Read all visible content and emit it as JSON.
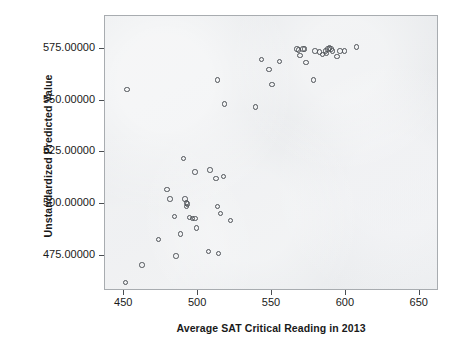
{
  "chart_data": {
    "type": "scatter",
    "title": "",
    "xlabel": "Average SAT Critical Reading in 2013",
    "ylabel": "Unstandardized Predicted Value",
    "xlim": [
      437,
      663
    ],
    "ylim": [
      458,
      591
    ],
    "xticks": [
      450,
      500,
      550,
      600,
      650
    ],
    "yticks": [
      475,
      500,
      525,
      550,
      575
    ],
    "xtick_labels": [
      "450",
      "500",
      "550",
      "600",
      "650"
    ],
    "ytick_labels": [
      "475.00000",
      "500.00000",
      "525.00000",
      "550.00000",
      "575.00000"
    ],
    "grid": false,
    "legend": null,
    "marker": "open-circle",
    "marker_color": "#4f5358",
    "plot_background": "#e8eaec",
    "points": [
      {
        "x": 451,
        "y": 462
      },
      {
        "x": 452,
        "y": 555.5
      },
      {
        "x": 462,
        "y": 470.5
      },
      {
        "x": 473,
        "y": 483
      },
      {
        "x": 479,
        "y": 507
      },
      {
        "x": 481,
        "y": 502.5
      },
      {
        "x": 484,
        "y": 494
      },
      {
        "x": 485,
        "y": 475
      },
      {
        "x": 488,
        "y": 485.5
      },
      {
        "x": 490,
        "y": 522
      },
      {
        "x": 491,
        "y": 502.5
      },
      {
        "x": 492,
        "y": 500.5
      },
      {
        "x": 492,
        "y": 499
      },
      {
        "x": 493,
        "y": 500
      },
      {
        "x": 494,
        "y": 493.5
      },
      {
        "x": 496,
        "y": 493
      },
      {
        "x": 498,
        "y": 493
      },
      {
        "x": 498,
        "y": 515.5
      },
      {
        "x": 499,
        "y": 488.5
      },
      {
        "x": 507,
        "y": 477
      },
      {
        "x": 508,
        "y": 516.5
      },
      {
        "x": 512,
        "y": 512.5
      },
      {
        "x": 513,
        "y": 560
      },
      {
        "x": 513,
        "y": 499
      },
      {
        "x": 514,
        "y": 476
      },
      {
        "x": 515,
        "y": 495.5
      },
      {
        "x": 517,
        "y": 513.5
      },
      {
        "x": 518,
        "y": 548.5
      },
      {
        "x": 522,
        "y": 492
      },
      {
        "x": 539,
        "y": 547
      },
      {
        "x": 543,
        "y": 570
      },
      {
        "x": 548,
        "y": 565
      },
      {
        "x": 550,
        "y": 558
      },
      {
        "x": 555,
        "y": 569
      },
      {
        "x": 567,
        "y": 575
      },
      {
        "x": 568,
        "y": 574.5
      },
      {
        "x": 569,
        "y": 572
      },
      {
        "x": 571,
        "y": 575
      },
      {
        "x": 572,
        "y": 575
      },
      {
        "x": 573,
        "y": 568.5
      },
      {
        "x": 578,
        "y": 560
      },
      {
        "x": 579,
        "y": 574
      },
      {
        "x": 582,
        "y": 573.5
      },
      {
        "x": 584,
        "y": 572.5
      },
      {
        "x": 586,
        "y": 574
      },
      {
        "x": 587,
        "y": 573
      },
      {
        "x": 588,
        "y": 575
      },
      {
        "x": 589,
        "y": 575.5
      },
      {
        "x": 590,
        "y": 575
      },
      {
        "x": 591,
        "y": 574
      },
      {
        "x": 594,
        "y": 571.5
      },
      {
        "x": 596,
        "y": 574
      },
      {
        "x": 599,
        "y": 574
      },
      {
        "x": 607,
        "y": 576
      }
    ]
  }
}
